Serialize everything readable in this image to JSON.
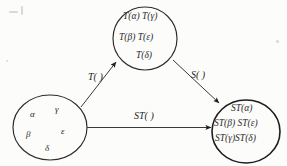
{
  "figure": {
    "type": "commutative-diagram",
    "background_color": "#fcfcfb",
    "ink_color": "#2a2a2a"
  },
  "nodes": {
    "source_set": {
      "name": "source-set",
      "elements": [
        {
          "text": "α",
          "x": 30,
          "y": 116
        },
        {
          "text": "γ",
          "x": 55,
          "y": 111
        },
        {
          "text": "β",
          "x": 26,
          "y": 136
        },
        {
          "text": "ε",
          "x": 61,
          "y": 133
        },
        {
          "text": "δ",
          "x": 45,
          "y": 150
        }
      ]
    },
    "image_under_t": {
      "name": "image-set-T",
      "rows": [
        {
          "text": "T(α)   T(γ)",
          "x": 123,
          "y": 18
        },
        {
          "text": "T(β)    T(ε)",
          "x": 119,
          "y": 39
        },
        {
          "text": "T(δ)",
          "x": 136,
          "y": 57
        }
      ]
    },
    "image_under_st": {
      "name": "image-set-ST",
      "rows": [
        {
          "text": "ST(α)",
          "x": 231,
          "y": 110
        },
        {
          "text": "ST(β)  ST(ε)",
          "x": 214,
          "y": 125
        },
        {
          "text": "ST(γ)ST(δ)",
          "x": 215,
          "y": 140
        }
      ]
    }
  },
  "edges": {
    "t_map": {
      "label": "T(  )",
      "x": 88,
      "y": 78
    },
    "s_map": {
      "label": "S(  )",
      "x": 191,
      "y": 76
    },
    "st_map": {
      "label": "ST(  )",
      "x": 131,
      "y": 117
    }
  }
}
